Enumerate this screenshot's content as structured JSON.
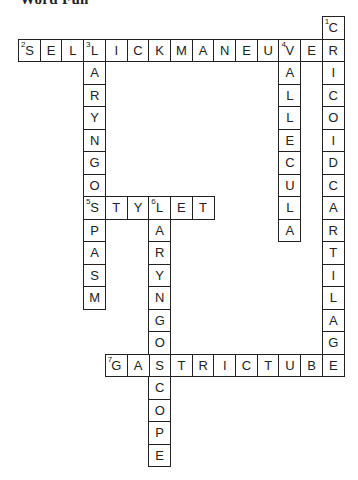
{
  "title": "Word Fun",
  "grid": {
    "origin_x": 18,
    "origin_y": 16,
    "cell_w": 21.7,
    "cell_h": 22.5
  },
  "entries": [
    {
      "number": 1,
      "direction": "down",
      "row": 0,
      "col": 14,
      "answer": "CRICOIDCARTILAGE"
    },
    {
      "number": 2,
      "direction": "across",
      "row": 1,
      "col": 0,
      "answer": "SELLICKMANEUVER"
    },
    {
      "number": 3,
      "direction": "down",
      "row": 1,
      "col": 3,
      "answer": "LARYNGOSPASM"
    },
    {
      "number": 4,
      "direction": "down",
      "row": 1,
      "col": 12,
      "answer": "VALLECULA"
    },
    {
      "number": 5,
      "direction": "across",
      "row": 8,
      "col": 3,
      "answer": "STYLET"
    },
    {
      "number": 6,
      "direction": "down",
      "row": 8,
      "col": 6,
      "answer": "LARYNGOSCOPE"
    },
    {
      "number": 7,
      "direction": "across",
      "row": 15,
      "col": 4,
      "answer": "GASTRICTUBE"
    }
  ]
}
